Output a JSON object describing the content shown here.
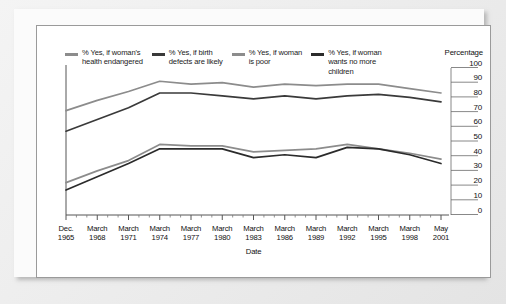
{
  "chart_data": {
    "type": "line",
    "title": "",
    "xlabel": "Date",
    "ylabel": "Percentage",
    "ylim": [
      0,
      100
    ],
    "ytick_step": 10,
    "yticks": [
      "100",
      "90",
      "80",
      "70",
      "60",
      "50",
      "40",
      "30",
      "20",
      "10",
      "0"
    ],
    "grid": false,
    "legend_position": "top",
    "categories": [
      "Dec.\n1965",
      "March\n1968",
      "March\n1971",
      "March\n1974",
      "March\n1977",
      "March\n1980",
      "March\n1983",
      "March\n1986",
      "March\n1989",
      "March\n1992",
      "March\n1995",
      "March\n1998",
      "May\n2001"
    ],
    "x_values": [
      "Dec. 1965",
      "March 1968",
      "March 1971",
      "March 1974",
      "March 1977",
      "March 1980",
      "March 1983",
      "March 1986",
      "March 1989",
      "March 1992",
      "March 1995",
      "March 1998",
      "May 2001"
    ],
    "series": [
      {
        "name": "% Yes, if woman's\nhealth endangered",
        "label": "% Yes, if woman's\nhealth endangered",
        "color": "#8c8c8c",
        "values": [
          71,
          78,
          84,
          91,
          89,
          90,
          87,
          89,
          88,
          89,
          89,
          86,
          83
        ]
      },
      {
        "name": "% Yes, if birth\ndefects are likely",
        "label": "% Yes, if birth\ndefects are likely",
        "color": "#3a3a3a",
        "values": [
          57,
          65,
          73,
          83,
          83,
          81,
          79,
          81,
          79,
          81,
          82,
          80,
          77
        ]
      },
      {
        "name": "% Yes, if woman\nis poor",
        "label": "% Yes, if woman\nis poor",
        "color": "#8c8c8c",
        "values": [
          22,
          30,
          37,
          48,
          47,
          47,
          43,
          44,
          45,
          48,
          45,
          42,
          38
        ]
      },
      {
        "name": "% Yes, if woman\nwants no more\nchildren",
        "label": "% Yes, if woman\nwants no more\nchildren",
        "color": "#2b2b2b",
        "values": [
          17,
          26,
          35,
          45,
          45,
          45,
          39,
          41,
          39,
          46,
          45,
          41,
          35
        ]
      }
    ],
    "percentage_header": "Percentage"
  }
}
